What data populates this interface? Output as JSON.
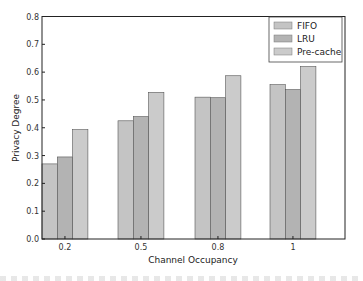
{
  "chart_data": {
    "type": "bar",
    "title": "",
    "xlabel": "Channel Occupancy",
    "ylabel": "Privacy Degree",
    "categories": [
      "0.2",
      "0.5",
      "0.8",
      "1"
    ],
    "series": [
      {
        "name": "FIFO",
        "color": "#c4c4c4",
        "values": [
          0.27,
          0.425,
          0.51,
          0.555
        ]
      },
      {
        "name": "LRU",
        "color": "#b3b3b3",
        "values": [
          0.295,
          0.44,
          0.508,
          0.537
        ]
      },
      {
        "name": "Pre-cache",
        "color": "#cbcbcb",
        "values": [
          0.393,
          0.527,
          0.587,
          0.62
        ]
      }
    ],
    "ylim": [
      0,
      0.8
    ],
    "yticks": [
      "0.0",
      "0.1",
      "0.2",
      "0.3",
      "0.4",
      "0.5",
      "0.6",
      "0.7",
      "0.8"
    ],
    "grid": false,
    "legend_position": "upper right"
  }
}
